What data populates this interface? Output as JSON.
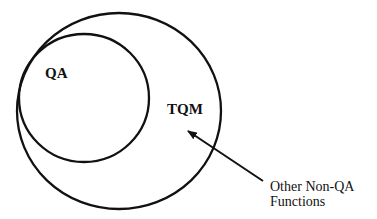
{
  "diagram": {
    "type": "nested-venn",
    "outer_circle": {
      "label": "TQM"
    },
    "inner_circle": {
      "label": "QA"
    },
    "annotation": {
      "lines": [
        "Other Non-QA",
        "Functions"
      ],
      "points_to": "TQM region outside QA"
    },
    "colors": {
      "stroke": "#111111",
      "background": "#ffffff"
    }
  }
}
